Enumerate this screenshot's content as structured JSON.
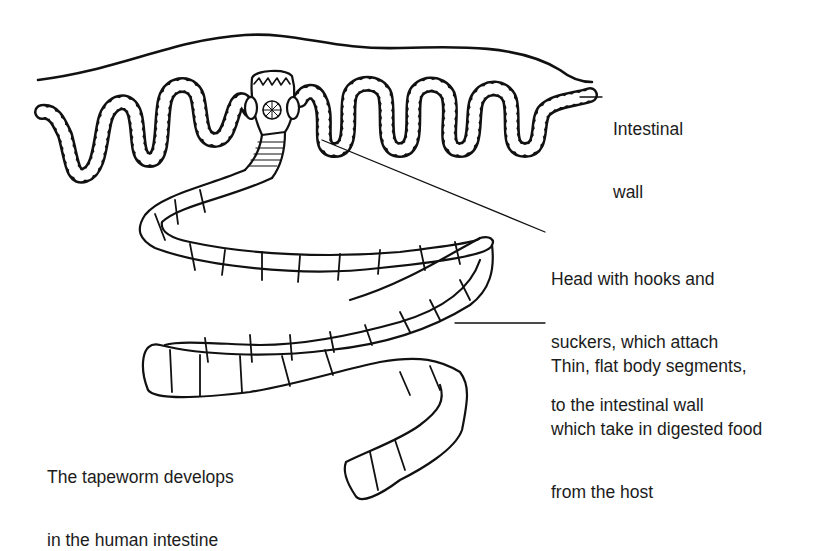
{
  "diagram": {
    "labels": {
      "intestinal_wall": [
        "Intestinal",
        "wall"
      ],
      "head": [
        "Head with hooks and",
        "suckers, which attach",
        "to the intestinal wall"
      ],
      "segments": [
        "Thin, flat body segments,",
        "which take in digested food",
        "from the host"
      ],
      "caption": [
        "The tapeworm develops",
        "in the human intestine"
      ]
    },
    "colors": {
      "line": "#111111",
      "background": "#ffffff",
      "text": "#1c1c1c"
    }
  }
}
